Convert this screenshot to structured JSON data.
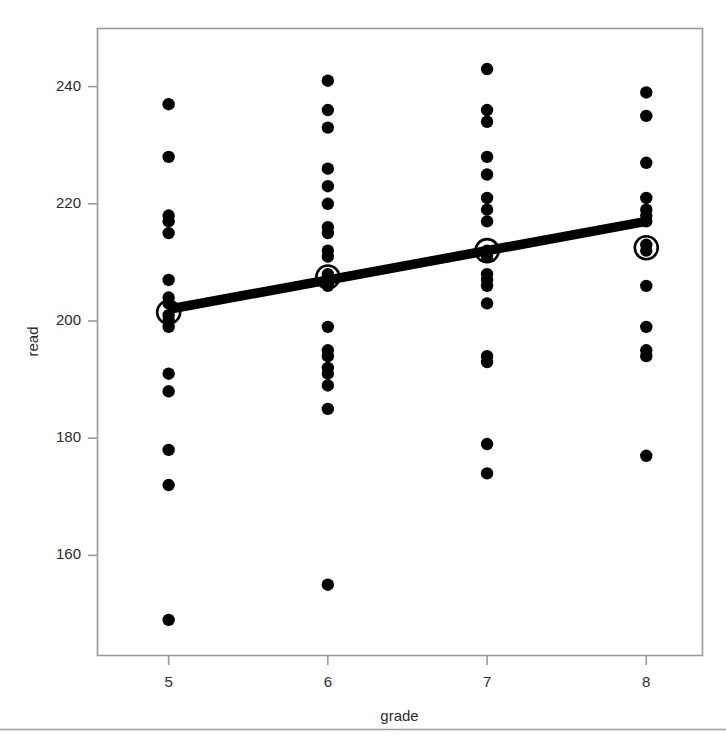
{
  "chart_data": {
    "type": "scatter",
    "title": "",
    "xlabel": "grade",
    "ylabel": "read",
    "xlim": [
      4.55,
      8.35
    ],
    "ylim": [
      143,
      250
    ],
    "xticks": [
      5,
      6,
      7,
      8
    ],
    "xticklabels": [
      "5",
      "6",
      "7",
      "8"
    ],
    "yticks": [
      160,
      180,
      200,
      220,
      240
    ],
    "yticklabels": [
      "160",
      "180",
      "200",
      "220",
      "240"
    ],
    "grid": false,
    "legend": "none",
    "frame": true,
    "point_color": "#000000",
    "line_color": "#000000",
    "mean_marker_color": "#000000",
    "frame_color": "#9a9a9a",
    "background_color": "#ffffff",
    "series": [
      {
        "name": "observations",
        "marker": "filled-circle",
        "points": [
          {
            "x": 5,
            "y": 237
          },
          {
            "x": 5,
            "y": 228
          },
          {
            "x": 5,
            "y": 218
          },
          {
            "x": 5,
            "y": 217
          },
          {
            "x": 5,
            "y": 215
          },
          {
            "x": 5,
            "y": 207
          },
          {
            "x": 5,
            "y": 204
          },
          {
            "x": 5,
            "y": 203
          },
          {
            "x": 5,
            "y": 201
          },
          {
            "x": 5,
            "y": 200
          },
          {
            "x": 5,
            "y": 199
          },
          {
            "x": 5,
            "y": 191
          },
          {
            "x": 5,
            "y": 188
          },
          {
            "x": 5,
            "y": 178
          },
          {
            "x": 5,
            "y": 172
          },
          {
            "x": 5,
            "y": 149
          },
          {
            "x": 6,
            "y": 241
          },
          {
            "x": 6,
            "y": 236
          },
          {
            "x": 6,
            "y": 233
          },
          {
            "x": 6,
            "y": 226
          },
          {
            "x": 6,
            "y": 223
          },
          {
            "x": 6,
            "y": 220
          },
          {
            "x": 6,
            "y": 216
          },
          {
            "x": 6,
            "y": 215
          },
          {
            "x": 6,
            "y": 212
          },
          {
            "x": 6,
            "y": 211
          },
          {
            "x": 6,
            "y": 208
          },
          {
            "x": 6,
            "y": 207
          },
          {
            "x": 6,
            "y": 206
          },
          {
            "x": 6,
            "y": 199
          },
          {
            "x": 6,
            "y": 195
          },
          {
            "x": 6,
            "y": 194
          },
          {
            "x": 6,
            "y": 192
          },
          {
            "x": 6,
            "y": 191
          },
          {
            "x": 6,
            "y": 189
          },
          {
            "x": 6,
            "y": 185
          },
          {
            "x": 6,
            "y": 155
          },
          {
            "x": 7,
            "y": 243
          },
          {
            "x": 7,
            "y": 236
          },
          {
            "x": 7,
            "y": 234
          },
          {
            "x": 7,
            "y": 228
          },
          {
            "x": 7,
            "y": 225
          },
          {
            "x": 7,
            "y": 221
          },
          {
            "x": 7,
            "y": 219
          },
          {
            "x": 7,
            "y": 217
          },
          {
            "x": 7,
            "y": 212
          },
          {
            "x": 7,
            "y": 211
          },
          {
            "x": 7,
            "y": 208
          },
          {
            "x": 7,
            "y": 207
          },
          {
            "x": 7,
            "y": 206
          },
          {
            "x": 7,
            "y": 203
          },
          {
            "x": 7,
            "y": 194
          },
          {
            "x": 7,
            "y": 193
          },
          {
            "x": 7,
            "y": 179
          },
          {
            "x": 7,
            "y": 174
          },
          {
            "x": 8,
            "y": 239
          },
          {
            "x": 8,
            "y": 235
          },
          {
            "x": 8,
            "y": 227
          },
          {
            "x": 8,
            "y": 221
          },
          {
            "x": 8,
            "y": 219
          },
          {
            "x": 8,
            "y": 218
          },
          {
            "x": 8,
            "y": 217
          },
          {
            "x": 8,
            "y": 213
          },
          {
            "x": 8,
            "y": 212
          },
          {
            "x": 8,
            "y": 206
          },
          {
            "x": 8,
            "y": 199
          },
          {
            "x": 8,
            "y": 195
          },
          {
            "x": 8,
            "y": 194
          },
          {
            "x": 8,
            "y": 177
          }
        ]
      },
      {
        "name": "group-means",
        "marker": "open-circle",
        "points": [
          {
            "x": 5,
            "y": 201.5
          },
          {
            "x": 6,
            "y": 207.5
          },
          {
            "x": 7,
            "y": 212.0
          },
          {
            "x": 8,
            "y": 212.5
          }
        ]
      },
      {
        "name": "regression-line",
        "marker": "line",
        "points": [
          {
            "x": 5,
            "y": 202.0
          },
          {
            "x": 8,
            "y": 217.0
          }
        ]
      }
    ]
  },
  "footer": {
    "rule": "horizontal-rule"
  }
}
